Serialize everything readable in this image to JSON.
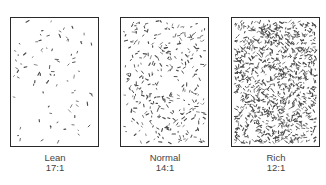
{
  "figure": {
    "panels": [
      {
        "name": "Lean",
        "ratio": "17:1",
        "density": 85,
        "seed": 7
      },
      {
        "name": "Normal",
        "ratio": "14:1",
        "density": 330,
        "seed": 13
      },
      {
        "name": "Rich",
        "ratio": "12:1",
        "density": 1100,
        "seed": 29
      }
    ],
    "colors": {
      "border": "#2a2a2a",
      "speckle": "#4a4a4a",
      "text": "#444444"
    }
  }
}
